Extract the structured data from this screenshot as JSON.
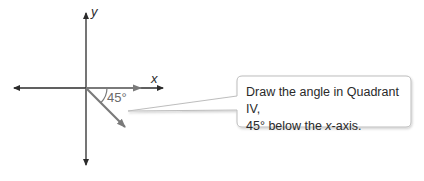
{
  "diagram": {
    "axes": {
      "x_label": "x",
      "y_label": "y"
    },
    "angle": {
      "label": "45°",
      "degrees": -45,
      "quadrant": "IV"
    },
    "callout": {
      "line1": "Draw the angle in Quadrant IV,",
      "line2_prefix": "45° below the ",
      "line2_var": "x",
      "line2_suffix": "-axis."
    },
    "colors": {
      "axis": "#2b2b2b",
      "ray": "#7a7a7a",
      "callout_border": "#bdbdbd",
      "text": "#2a2a2a"
    }
  }
}
